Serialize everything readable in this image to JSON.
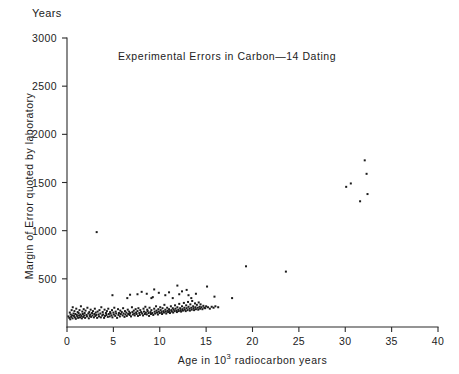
{
  "figure": {
    "unit_label": "Years",
    "title": "Experimental Errors in Carbon—14  Dating",
    "ylabel": "Margin of Error quoted by  laboratory",
    "xlabel_prefix": "Age in 10",
    "xlabel_exponent": "3",
    "xlabel_suffix": " radiocarbon years",
    "point_color": "#1b1b1b",
    "axis_color": "#2b2b2b",
    "background": "#ffffff"
  },
  "chart_data": {
    "type": "scatter",
    "title": "Experimental Errors in Carbon—14  Dating",
    "xlabel": "Age in 10^3 radiocarbon years",
    "ylabel": "Margin of Error quoted by laboratory",
    "yunit": "Years",
    "xlim": [
      0,
      40
    ],
    "ylim": [
      0,
      3000
    ],
    "xticks": [
      0,
      5,
      10,
      15,
      20,
      25,
      30,
      35,
      40
    ],
    "yticks": [
      500,
      1000,
      1500,
      2000,
      2500,
      3000
    ],
    "xticklabels": [
      "0",
      "5",
      "10",
      "15",
      "20",
      "25",
      "30",
      "35",
      "40"
    ],
    "yticklabels": [
      "500",
      "1000",
      "1500",
      "2000",
      "2500",
      "3000"
    ],
    "grid": false,
    "legend": null,
    "marker": "square",
    "marker_size_px": 2,
    "series": [
      {
        "name": "Laboratory quoted error vs radiocarbon age",
        "points": [
          [
            0.15,
            110
          ],
          [
            0.25,
            95
          ],
          [
            0.3,
            150
          ],
          [
            0.35,
            80
          ],
          [
            0.4,
            130
          ],
          [
            0.45,
            105
          ],
          [
            0.5,
            175
          ],
          [
            0.55,
            120
          ],
          [
            0.6,
            90
          ],
          [
            0.62,
            205
          ],
          [
            0.7,
            140
          ],
          [
            0.75,
            115
          ],
          [
            0.8,
            165
          ],
          [
            0.85,
            100
          ],
          [
            0.9,
            135
          ],
          [
            0.95,
            85
          ],
          [
            1.0,
            190
          ],
          [
            1.05,
            125
          ],
          [
            1.1,
            110
          ],
          [
            1.15,
            155
          ],
          [
            1.2,
            95
          ],
          [
            1.25,
            145
          ],
          [
            1.3,
            120
          ],
          [
            1.35,
            175
          ],
          [
            1.4,
            100
          ],
          [
            1.45,
            130
          ],
          [
            1.5,
            215
          ],
          [
            1.55,
            115
          ],
          [
            1.6,
            90
          ],
          [
            1.65,
            160
          ],
          [
            1.7,
            135
          ],
          [
            1.75,
            105
          ],
          [
            1.8,
            185
          ],
          [
            1.85,
            120
          ],
          [
            1.9,
            145
          ],
          [
            1.95,
            95
          ],
          [
            2.0,
            170
          ],
          [
            2.1,
            125
          ],
          [
            2.15,
            110
          ],
          [
            2.2,
            200
          ],
          [
            2.3,
            140
          ],
          [
            2.35,
            90
          ],
          [
            2.4,
            155
          ],
          [
            2.45,
            115
          ],
          [
            2.5,
            130
          ],
          [
            2.55,
            180
          ],
          [
            2.6,
            105
          ],
          [
            2.7,
            145
          ],
          [
            2.75,
            120
          ],
          [
            2.8,
            165
          ],
          [
            2.9,
            100
          ],
          [
            2.95,
            135
          ],
          [
            3.0,
            190
          ],
          [
            3.05,
            115
          ],
          [
            3.1,
            150
          ],
          [
            3.15,
            125
          ],
          [
            3.2,
            985
          ],
          [
            3.25,
            95
          ],
          [
            3.3,
            160
          ],
          [
            3.4,
            130
          ],
          [
            3.45,
            110
          ],
          [
            3.5,
            175
          ],
          [
            3.6,
            140
          ],
          [
            3.65,
            100
          ],
          [
            3.7,
            205
          ],
          [
            3.8,
            120
          ],
          [
            3.85,
            155
          ],
          [
            3.9,
            130
          ],
          [
            4.0,
            95
          ],
          [
            4.05,
            180
          ],
          [
            4.1,
            115
          ],
          [
            4.2,
            145
          ],
          [
            4.25,
            125
          ],
          [
            4.3,
            165
          ],
          [
            4.4,
            105
          ],
          [
            4.45,
            190
          ],
          [
            4.5,
            135
          ],
          [
            4.6,
            110
          ],
          [
            4.65,
            155
          ],
          [
            4.7,
            140
          ],
          [
            4.8,
            120
          ],
          [
            4.85,
            175
          ],
          [
            4.9,
            100
          ],
          [
            5.0,
            150
          ],
          [
            5.05,
            130
          ],
          [
            5.1,
            200
          ],
          [
            5.2,
            115
          ],
          [
            5.25,
            160
          ],
          [
            5.3,
            140
          ],
          [
            5.4,
            95
          ],
          [
            5.5,
            185
          ],
          [
            5.55,
            125
          ],
          [
            5.6,
            145
          ],
          [
            5.7,
            110
          ],
          [
            5.75,
            170
          ],
          [
            5.8,
            135
          ],
          [
            5.9,
            155
          ],
          [
            6.0,
            120
          ],
          [
            6.05,
            195
          ],
          [
            6.1,
            140
          ],
          [
            6.2,
            105
          ],
          [
            6.25,
            165
          ],
          [
            6.3,
            130
          ],
          [
            6.4,
            150
          ],
          [
            6.45,
            115
          ],
          [
            6.5,
            300
          ],
          [
            6.55,
            180
          ],
          [
            6.6,
            135
          ],
          [
            6.7,
            160
          ],
          [
            6.75,
            125
          ],
          [
            6.8,
            145
          ],
          [
            6.9,
            110
          ],
          [
            7.0,
            205
          ],
          [
            7.05,
            155
          ],
          [
            7.1,
            130
          ],
          [
            7.2,
            170
          ],
          [
            7.25,
            140
          ],
          [
            7.3,
            120
          ],
          [
            7.4,
            185
          ],
          [
            7.45,
            150
          ],
          [
            7.5,
            135
          ],
          [
            7.6,
            165
          ],
          [
            7.65,
            115
          ],
          [
            7.7,
            195
          ],
          [
            7.8,
            145
          ],
          [
            7.85,
            125
          ],
          [
            7.9,
            175
          ],
          [
            8.0,
            155
          ],
          [
            8.05,
            365
          ],
          [
            8.1,
            140
          ],
          [
            8.2,
            120
          ],
          [
            8.25,
            190
          ],
          [
            8.3,
            160
          ],
          [
            8.4,
            135
          ],
          [
            8.45,
            210
          ],
          [
            8.5,
            150
          ],
          [
            8.6,
            130
          ],
          [
            8.65,
            180
          ],
          [
            8.7,
            165
          ],
          [
            8.8,
            145
          ],
          [
            8.85,
            115
          ],
          [
            8.9,
            200
          ],
          [
            9.0,
            155
          ],
          [
            9.05,
            135
          ],
          [
            9.1,
            175
          ],
          [
            9.2,
            145
          ],
          [
            9.25,
            310
          ],
          [
            9.3,
            125
          ],
          [
            9.4,
            190
          ],
          [
            9.45,
            160
          ],
          [
            9.5,
            140
          ],
          [
            9.6,
            215
          ],
          [
            9.65,
            170
          ],
          [
            9.7,
            150
          ],
          [
            9.8,
            130
          ],
          [
            9.85,
            185
          ],
          [
            9.9,
            160
          ],
          [
            10.0,
            145
          ],
          [
            10.05,
            205
          ],
          [
            10.1,
            175
          ],
          [
            10.2,
            155
          ],
          [
            10.25,
            135
          ],
          [
            10.3,
            195
          ],
          [
            10.4,
            165
          ],
          [
            10.45,
            150
          ],
          [
            10.5,
            230
          ],
          [
            10.6,
            180
          ],
          [
            10.65,
            160
          ],
          [
            10.7,
            140
          ],
          [
            10.8,
            200
          ],
          [
            10.85,
            170
          ],
          [
            10.9,
            155
          ],
          [
            11.0,
            185
          ],
          [
            11.05,
            165
          ],
          [
            11.1,
            145
          ],
          [
            11.2,
            215
          ],
          [
            11.25,
            175
          ],
          [
            11.3,
            160
          ],
          [
            11.4,
            195
          ],
          [
            11.45,
            150
          ],
          [
            11.5,
            180
          ],
          [
            11.6,
            165
          ],
          [
            11.65,
            225
          ],
          [
            11.7,
            190
          ],
          [
            11.8,
            170
          ],
          [
            11.85,
            155
          ],
          [
            11.9,
            205
          ],
          [
            12.0,
            180
          ],
          [
            12.05,
            165
          ],
          [
            12.1,
            240
          ],
          [
            12.2,
            195
          ],
          [
            12.25,
            175
          ],
          [
            12.3,
            160
          ],
          [
            12.4,
            215
          ],
          [
            12.45,
            185
          ],
          [
            12.5,
            170
          ],
          [
            12.6,
            250
          ],
          [
            12.65,
            200
          ],
          [
            12.7,
            180
          ],
          [
            12.8,
            165
          ],
          [
            12.85,
            225
          ],
          [
            12.9,
            195
          ],
          [
            13.0,
            175
          ],
          [
            13.05,
            260
          ],
          [
            13.1,
            210
          ],
          [
            13.2,
            190
          ],
          [
            13.25,
            170
          ],
          [
            13.3,
            235
          ],
          [
            13.4,
            200
          ],
          [
            13.45,
            180
          ],
          [
            13.5,
            270
          ],
          [
            13.6,
            215
          ],
          [
            13.65,
            195
          ],
          [
            13.7,
            175
          ],
          [
            13.8,
            245
          ],
          [
            13.85,
            205
          ],
          [
            13.9,
            185
          ],
          [
            14.0,
            230
          ],
          [
            14.1,
            200
          ],
          [
            14.15,
            180
          ],
          [
            14.2,
            255
          ],
          [
            14.3,
            210
          ],
          [
            14.35,
            190
          ],
          [
            14.4,
            235
          ],
          [
            14.5,
            205
          ],
          [
            14.6,
            185
          ],
          [
            14.7,
            220
          ],
          [
            14.8,
            200
          ],
          [
            14.9,
            195
          ],
          [
            15.0,
            215
          ],
          [
            15.2,
            205
          ],
          [
            15.4,
            190
          ],
          [
            15.6,
            210
          ],
          [
            15.8,
            200
          ],
          [
            16.0,
            215
          ],
          [
            16.3,
            205
          ],
          [
            4.9,
            330
          ],
          [
            6.8,
            335
          ],
          [
            7.6,
            340
          ],
          [
            8.6,
            345
          ],
          [
            9.1,
            300
          ],
          [
            9.4,
            390
          ],
          [
            9.9,
            355
          ],
          [
            10.6,
            330
          ],
          [
            11.0,
            360
          ],
          [
            11.4,
            300
          ],
          [
            11.9,
            430
          ],
          [
            12.1,
            340
          ],
          [
            12.4,
            370
          ],
          [
            12.9,
            385
          ],
          [
            13.1,
            330
          ],
          [
            13.4,
            300
          ],
          [
            13.9,
            345
          ],
          [
            15.1,
            420
          ],
          [
            15.9,
            315
          ],
          [
            17.8,
            300
          ],
          [
            19.3,
            630
          ],
          [
            23.6,
            575
          ],
          [
            30.1,
            1455
          ],
          [
            30.6,
            1490
          ],
          [
            31.6,
            1305
          ],
          [
            32.1,
            1730
          ],
          [
            32.3,
            1590
          ],
          [
            32.4,
            1380
          ]
        ]
      }
    ]
  }
}
